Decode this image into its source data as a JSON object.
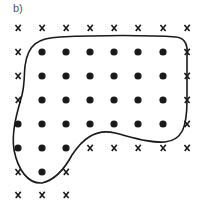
{
  "figure": {
    "label": "b)",
    "ink_color": "#1a1a1a",
    "grid": {
      "columns_x": [
        18,
        42,
        66,
        90,
        114,
        138,
        163,
        187
      ],
      "rows_y": [
        28,
        52,
        76,
        100,
        124,
        148,
        172,
        195
      ],
      "rows": [
        [
          "x",
          "x",
          "x",
          "x",
          "x",
          "x",
          "x",
          "x"
        ],
        [
          "x",
          "o",
          "o",
          "o",
          "o",
          "o",
          "o",
          "x"
        ],
        [
          "x",
          "o",
          "o",
          "o",
          "o",
          "o",
          "o",
          "x"
        ],
        [
          "x",
          "o",
          "o",
          "o",
          "o",
          "o",
          "o",
          "x"
        ],
        [
          "o",
          "o",
          "o",
          "o",
          "o",
          "o",
          "o",
          "x"
        ],
        [
          "o",
          "o",
          "o",
          "x",
          "x",
          "x",
          "x",
          "x"
        ],
        [
          "x",
          "o",
          "x"
        ],
        [
          "x",
          "x",
          "x"
        ]
      ],
      "legend": {
        "o": "dot (inside region)",
        "x": "cross (outside region)"
      }
    },
    "boundary_curve": "M 25 66 C 28 44 38 38 60 37 C 100 35 150 35 176 37 C 186 38 188 46 187 56 L 187 100 C 187 128 182 140 165 142 C 150 143 135 138 115 133 C 95 128 82 140 72 155 C 64 170 55 180 42 183 C 28 184 18 170 14 150 C 11 130 18 110 22 95 C 25 82 24 74 25 66 Z"
  }
}
